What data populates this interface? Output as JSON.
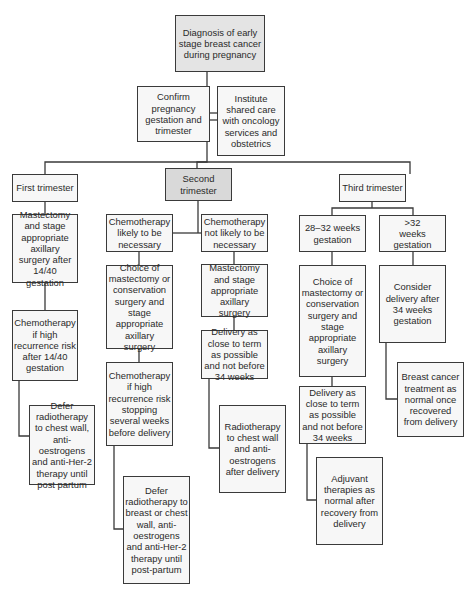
{
  "diagram": {
    "type": "flowchart",
    "nodes": {
      "root": "Diagnosis of early stage breast cancer during pregnancy",
      "confirm": "Confirm pregnancy gestation and trimester",
      "shared_care": "Institute shared care with oncology services and obstetrics",
      "first": {
        "title": "First trimester",
        "surgery": "Mastectomy and stage appropriate axillary surgery after 14/40 gestation",
        "chemo": "Chemotherapy if high recurrence risk after 14/40 gestation",
        "defer": "Defer radiotherapy to chest wall, anti-oestrogens and anti-Her-2 therapy until post partum"
      },
      "second": {
        "title": "Second trimester",
        "chemo_likely": {
          "label": "Chemotherapy likely to be necessary",
          "choice": "Choice of mastectomy or conservation surgery and stage appropriate axillary surgery",
          "chemo": "Chemotherapy if high recurrence risk stopping several weeks before delivery",
          "defer": "Defer radiotherapy to breast or chest wall, anti-oestrogens and anti-Her-2 therapy until post-partum"
        },
        "chemo_not_likely": {
          "label": "Chemotherapy not likely to be necessary",
          "surgery": "Mastectomy and stage appropriate axillary surgery",
          "delivery": "Delivery as close to term as possible and not before 34 weeks",
          "radio": "Radiotherapy to chest wall and anti-oestrogens after delivery"
        }
      },
      "third": {
        "title": "Third trimester",
        "weeks_28_32": {
          "label": "28–32 weeks gestation",
          "choice": "Choice of mastectomy or conservation surgery and stage appropriate axillary surgery",
          "delivery": "Delivery as close to term as possible and not before 34 weeks",
          "adjuvant": "Adjuvant therapies as normal after recovery from delivery"
        },
        "weeks_over_32": {
          "label": ">32 weeks gestation",
          "consider": "Consider delivery after 34 weeks gestation",
          "treatment": "Breast cancer treatment as normal once recovered from delivery"
        }
      }
    },
    "colors": {
      "border": "#3a3a3a",
      "box_fill": "#f7f7f7",
      "root_fill": "#e4e4e4",
      "second_trimester_fill": "#d9d9d9"
    }
  }
}
